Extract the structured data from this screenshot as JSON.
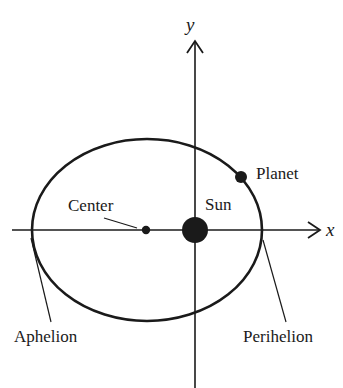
{
  "diagram": {
    "axes": {
      "x_label": "x",
      "y_label": "y"
    },
    "labels": {
      "center": "Center",
      "sun": "Sun",
      "planet": "Planet",
      "aphelion": "Aphelion",
      "perihelion": "Perihelion"
    },
    "colors": {
      "stroke": "#1a1a1a",
      "background": "#ffffff"
    }
  }
}
